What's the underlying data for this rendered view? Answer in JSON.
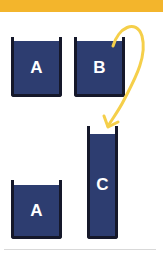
{
  "diagram": {
    "colors": {
      "top_bar": "#f3b52c",
      "liquid": "#2d3d70",
      "beaker_outline": "#15182a",
      "arrow": "#f5cf4a",
      "label": "#ffffff"
    },
    "beakers": [
      {
        "id": "A-top",
        "label": "A"
      },
      {
        "id": "B",
        "label": "B"
      },
      {
        "id": "A-bottom",
        "label": "A"
      },
      {
        "id": "C",
        "label": "C"
      }
    ],
    "arrow": {
      "from": "B",
      "to": "C",
      "meaning": "pour"
    }
  }
}
